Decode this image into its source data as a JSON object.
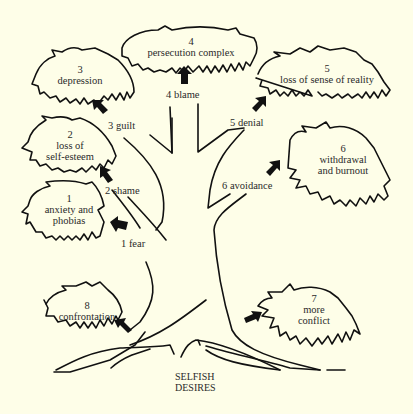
{
  "diagram": {
    "root": {
      "line1": "SELFISH",
      "line2": "DESIRES"
    },
    "branches": [
      {
        "num": "1",
        "label": "fear"
      },
      {
        "num": "2",
        "label": "shame"
      },
      {
        "num": "3",
        "label": "guilt"
      },
      {
        "num": "4",
        "label": "blame"
      },
      {
        "num": "5",
        "label": "denial"
      },
      {
        "num": "6",
        "label": "avoidance"
      }
    ],
    "branch_labels": {
      "fear": "1  fear",
      "shame": "2  shame",
      "guilt": "3  guilt",
      "blame": "4  blame",
      "denial": "5  denial",
      "avoidance": "6  avoidance"
    },
    "clouds": [
      {
        "num": "1",
        "text": "anxiety and\nphobias"
      },
      {
        "num": "2",
        "text": "loss of\nself-esteem"
      },
      {
        "num": "3",
        "text": "depression"
      },
      {
        "num": "4",
        "text": "persecution complex"
      },
      {
        "num": "5",
        "text": "loss of sense of reality"
      },
      {
        "num": "6",
        "text": "withdrawal\nand burnout"
      },
      {
        "num": "7",
        "text": "more\nconflict"
      },
      {
        "num": "8",
        "text": "confrontation"
      }
    ],
    "colors": {
      "background": "#fefee8",
      "ink": "#111111"
    }
  }
}
